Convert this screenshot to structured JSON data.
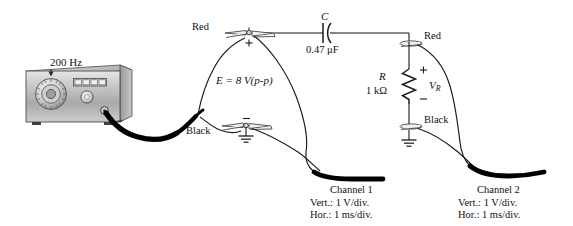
{
  "diagram": {
    "title_note": "RC series circuit driven by function generator with two oscilloscope channels",
    "generator": {
      "frequency_label": "200 Hz",
      "icon": "function-generator-icon"
    },
    "source": {
      "emf_label": "E = 8 V(p-p)",
      "emf_symbol": "E",
      "emf_value": "8 V(p-p)",
      "plus_marker": "+",
      "minus_marker": "−"
    },
    "capacitor": {
      "designator": "C",
      "value": "0.47 μF",
      "icon": "capacitor-icon"
    },
    "resistor": {
      "designator": "R",
      "value": "1 kΩ",
      "voltage_symbol": "V",
      "voltage_subscript": "R",
      "plus_marker": "+",
      "minus_marker": "−",
      "icon": "resistor-icon"
    },
    "terminals": {
      "left_red": "Red",
      "left_black": "Black",
      "right_red": "Red",
      "right_black": "Black"
    },
    "ground": {
      "icon": "ground-icon",
      "count": 2
    },
    "channel1": {
      "name": "Channel 1",
      "vert": "Vert.:   1 V/div.",
      "hor": "Hor.:    1 ms/div."
    },
    "channel2": {
      "name": "Channel 2",
      "vert": "Vert.:   1 V/div.",
      "hor": "Hor.:    1 ms/div."
    },
    "colors": {
      "line": "#1a1a1a",
      "wire": "#000000",
      "panel_light": "#d8d8d8",
      "panel_mid": "#b4b4b4",
      "panel_dark": "#8a8a8a",
      "background": "#ffffff"
    }
  }
}
